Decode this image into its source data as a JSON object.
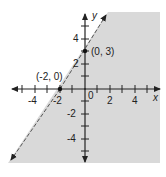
{
  "graph": {
    "description": "Graph of linear inequality y <= (3/2)x + 3 shaded region",
    "shade_color": "#d9d9d9",
    "axis_color": "#222222",
    "axes": {
      "x_label": "x",
      "y_label": "y"
    },
    "x_ticks": [
      "-4",
      "-2",
      "0",
      "2",
      "4"
    ],
    "y_ticks": [
      "4",
      "2",
      "-2",
      "-4"
    ],
    "points": [
      {
        "label": "(-2, 0)",
        "x": -2,
        "y": 0
      },
      {
        "label": "(0, 3)",
        "x": 0,
        "y": 3
      }
    ],
    "boundary": {
      "style": "dashed",
      "equation": "y = (3/2)x + 3"
    }
  }
}
